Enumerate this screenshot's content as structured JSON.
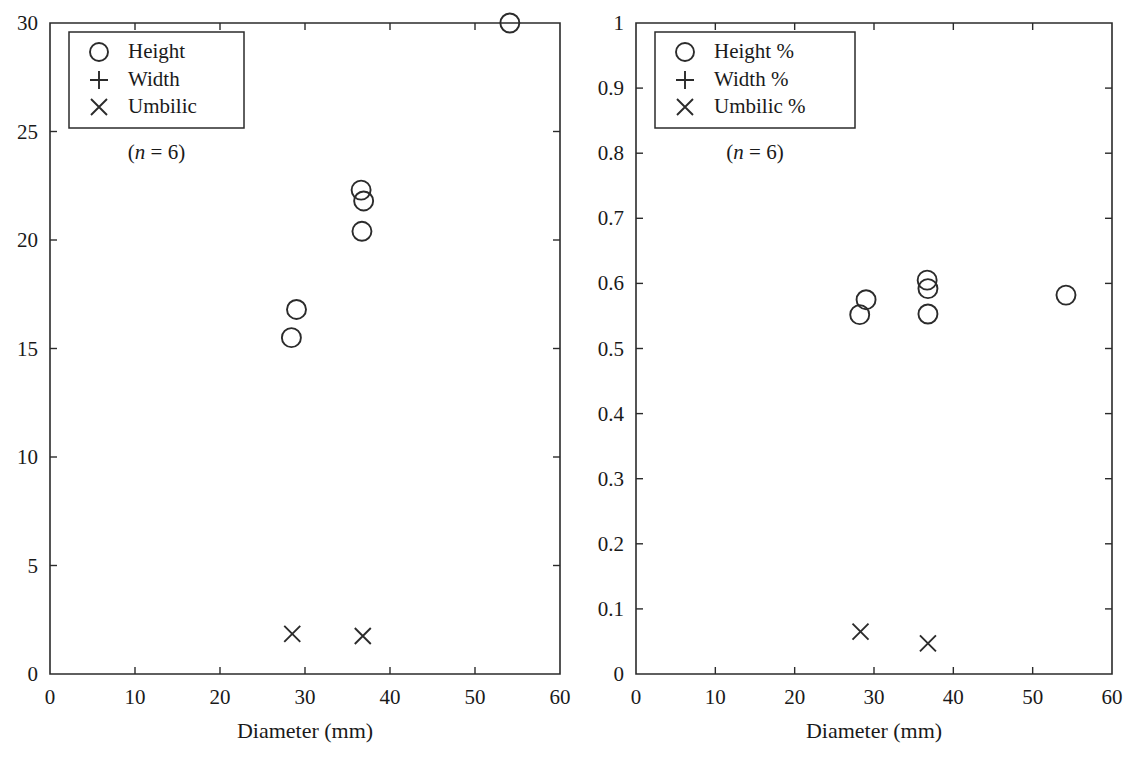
{
  "figure": {
    "background": "#ffffff",
    "ink_color": "#2b2b2b"
  },
  "chart_data": [
    {
      "type": "scatter",
      "panel": "left",
      "title": "",
      "xlabel": "Diameter (mm)",
      "ylabel": "",
      "xlim": [
        0,
        60
      ],
      "ylim": [
        0,
        30
      ],
      "xticks": [
        0,
        10,
        20,
        30,
        40,
        50,
        60
      ],
      "yticks": [
        0,
        5,
        10,
        15,
        20,
        25,
        30
      ],
      "xtick_labels": [
        "0",
        "10",
        "20",
        "30",
        "40",
        "50",
        "60"
      ],
      "ytick_labels": [
        "0",
        "5",
        "10",
        "15",
        "20",
        "25",
        "30"
      ],
      "grid": false,
      "legend_position": "upper-left",
      "annotation": "(n = 6)",
      "annotation_italic_part": "n",
      "annotation_rest": " = 6)",
      "annotation_open": "(",
      "series": [
        {
          "name": "Height",
          "marker": "circle",
          "points": [
            {
              "x": 28.4,
              "y": 15.5
            },
            {
              "x": 29.0,
              "y": 16.8
            },
            {
              "x": 36.6,
              "y": 22.3
            },
            {
              "x": 36.9,
              "y": 21.8
            },
            {
              "x": 36.7,
              "y": 20.4
            },
            {
              "x": 54.1,
              "y": 30.0
            }
          ]
        },
        {
          "name": "Width",
          "marker": "plus",
          "points": []
        },
        {
          "name": "Umbilic",
          "marker": "cross",
          "points": [
            {
              "x": 28.5,
              "y": 1.85
            },
            {
              "x": 36.8,
              "y": 1.75
            }
          ]
        }
      ]
    },
    {
      "type": "scatter",
      "panel": "right",
      "title": "",
      "xlabel": "Diameter (mm)",
      "ylabel": "",
      "xlim": [
        0,
        60
      ],
      "ylim": [
        0,
        1
      ],
      "xticks": [
        0,
        10,
        20,
        30,
        40,
        50,
        60
      ],
      "yticks": [
        0,
        0.1,
        0.2,
        0.3,
        0.4,
        0.5,
        0.6,
        0.7,
        0.8,
        0.9,
        1
      ],
      "xtick_labels": [
        "0",
        "10",
        "20",
        "30",
        "40",
        "50",
        "60"
      ],
      "ytick_labels": [
        "0",
        "0.1",
        "0.2",
        "0.3",
        "0.4",
        "0.5",
        "0.6",
        "0.7",
        "0.8",
        "0.9",
        "1"
      ],
      "grid": false,
      "legend_position": "upper-left",
      "annotation": "(n = 6)",
      "annotation_italic_part": "n",
      "annotation_rest": " = 6)",
      "annotation_open": "(",
      "series": [
        {
          "name": "Height %",
          "marker": "circle",
          "points": [
            {
              "x": 28.2,
              "y": 0.552
            },
            {
              "x": 29.0,
              "y": 0.575
            },
            {
              "x": 36.7,
              "y": 0.605
            },
            {
              "x": 36.8,
              "y": 0.592
            },
            {
              "x": 36.8,
              "y": 0.553
            },
            {
              "x": 54.2,
              "y": 0.582
            }
          ]
        },
        {
          "name": "Width %",
          "marker": "plus",
          "points": []
        },
        {
          "name": "Umbilic %",
          "marker": "cross",
          "points": [
            {
              "x": 28.3,
              "y": 0.065
            },
            {
              "x": 36.8,
              "y": 0.047
            }
          ]
        }
      ]
    }
  ]
}
